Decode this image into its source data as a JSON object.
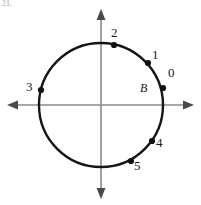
{
  "figure": {
    "problem_number": "21.",
    "colors": {
      "circle_stroke": "#151515",
      "axis_stroke": "#8a8a8a",
      "point_fill": "#111111",
      "label_text": "#1a1a1a",
      "background": "#ffffff"
    },
    "circle": {
      "center_x": 101,
      "center_y": 105,
      "radius": 62,
      "stroke_width": 2.4
    },
    "axes": {
      "x_axis": {
        "x1": 8,
        "y1": 105,
        "x2": 193,
        "y2": 105,
        "arrows": "both"
      },
      "y_axis": {
        "x1": 101,
        "y1": 10,
        "x2": 101,
        "y2": 198,
        "arrows": "both"
      },
      "stroke_width": 1.6
    },
    "center_label": {
      "name": "B",
      "text": "B",
      "x": 140,
      "y": 82
    },
    "points": [
      {
        "name": "point-0",
        "label": "0",
        "x": 163,
        "y": 88,
        "label_x": 168,
        "label_y": 66
      },
      {
        "name": "point-1",
        "label": "1",
        "x": 148,
        "y": 63,
        "label_x": 152,
        "label_y": 48
      },
      {
        "name": "point-2",
        "label": "2",
        "x": 114,
        "y": 45,
        "label_x": 111,
        "label_y": 26
      },
      {
        "name": "point-3",
        "label": "3",
        "x": 41,
        "y": 90,
        "label_x": 26,
        "label_y": 80
      },
      {
        "name": "point-4",
        "label": "4",
        "x": 152,
        "y": 141,
        "label_x": 156,
        "label_y": 136
      },
      {
        "name": "point-5",
        "label": "5",
        "x": 131,
        "y": 161,
        "label_x": 134,
        "label_y": 159
      }
    ],
    "point_radius": 3.1
  }
}
